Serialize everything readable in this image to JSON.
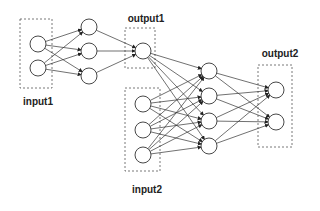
{
  "labels": {
    "input1": "input1",
    "output1": "output1",
    "input2": "input2",
    "output2": "output2"
  },
  "colors": {
    "stroke": "#333333",
    "box": "#555555",
    "fill": "#ffffff"
  },
  "layers": {
    "input1": [
      [
        38,
        44
      ],
      [
        38,
        68
      ]
    ],
    "hidden1": [
      [
        89,
        27
      ],
      [
        89,
        51
      ],
      [
        89,
        76
      ]
    ],
    "output1": [
      [
        143,
        51
      ]
    ],
    "input2": [
      [
        143,
        104
      ],
      [
        143,
        130
      ],
      [
        143,
        155
      ]
    ],
    "hidden2": [
      [
        209,
        71
      ],
      [
        209,
        96
      ],
      [
        209,
        121
      ],
      [
        209,
        146
      ]
    ],
    "output2": [
      [
        276,
        90
      ],
      [
        276,
        122
      ]
    ]
  },
  "boxes": {
    "input1": [
      20,
      19,
      32,
      69
    ],
    "output1": [
      125,
      28,
      30,
      40
    ],
    "input2": [
      125,
      88,
      35,
      83
    ],
    "output2": [
      258,
      65,
      34,
      82
    ]
  },
  "node_radius": 8
}
